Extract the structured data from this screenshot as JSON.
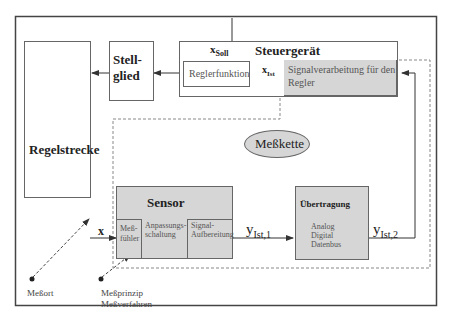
{
  "diagram": {
    "blocks": {
      "regelstrecke": "Regelstrecke",
      "stellglied_line1": "Stell-",
      "stellglied_line2": "glied",
      "steuergeraet": "Steuergerät",
      "reglerfunktion": "Reglerfunktion",
      "signalverarbeitung_line1": "Signalverarbeitung für den",
      "signalverarbeitung_line2": "Regler",
      "messkette": "Meßkette",
      "sensor": "Sensor",
      "messfuehler_line1": "Meß-",
      "messfuehler_line2": "fühler",
      "anpassung_line1": "Anpassungs-",
      "anpassung_line2": "schaltung",
      "aufbereitung_line1": "Signal-",
      "aufbereitung_line2": "Aufbereitung",
      "uebertragung": "Übertragung",
      "uebertragung_items": [
        "Analog",
        "Digital",
        "Datenbus"
      ]
    },
    "signals": {
      "x_soll_base": "x",
      "x_soll_sub": "Soll",
      "x_ist_base": "x",
      "x_ist_sub": "Ist",
      "x": "x",
      "y1_base": "y",
      "y1_sub": "Ist,1",
      "y2_base": "y",
      "y2_sub": "Ist,2"
    },
    "annotations": {
      "messort": "Meßort",
      "messprinzip": "Meßprinzip",
      "messverfahren": "Meßverfahren"
    }
  }
}
